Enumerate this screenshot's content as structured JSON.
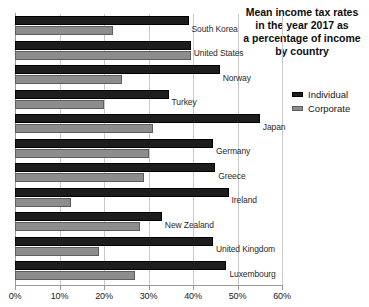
{
  "chart_data": {
    "type": "bar",
    "orientation": "horizontal",
    "title": "Mean income tax rates in the year 2017 as a percentage of income by country",
    "title_lines": [
      "Mean income tax rates",
      "in the year 2017 as",
      "a percentage of income",
      "by country"
    ],
    "xlabel": "",
    "ylabel": "",
    "xlim": [
      0,
      60
    ],
    "grid": true,
    "legend_position": "right",
    "xticks": [
      0,
      10,
      20,
      30,
      40,
      50,
      60
    ],
    "xticklabels": [
      "0%",
      "10%",
      "20%",
      "30%",
      "40%",
      "50%",
      "60%"
    ],
    "categories": [
      "South Korea",
      "United States",
      "Norway",
      "Turkey",
      "Japan",
      "Germany",
      "Greece",
      "Ireland",
      "New Zealand",
      "United Kingdom",
      "Luxembourg"
    ],
    "series": [
      {
        "name": "Individual",
        "color": "#1d1d1d",
        "values": [
          39.0,
          39.5,
          46.0,
          34.5,
          55.0,
          44.5,
          45.0,
          48.0,
          33.0,
          44.5,
          47.5
        ]
      },
      {
        "name": "Corporate",
        "color": "#8d8d8d",
        "values": [
          22.0,
          39.5,
          24.0,
          20.0,
          31.0,
          30.0,
          29.0,
          12.5,
          28.0,
          18.8,
          27.0
        ]
      }
    ]
  },
  "legend": {
    "items": [
      {
        "label": "Individual",
        "color": "#1d1d1d"
      },
      {
        "label": "Corporate",
        "color": "#8d8d8d"
      }
    ]
  }
}
